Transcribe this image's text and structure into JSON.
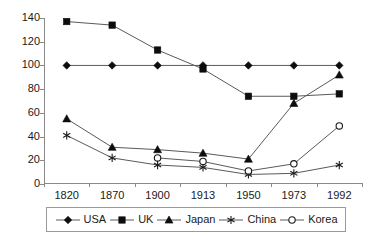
{
  "chart_data": {
    "type": "line",
    "title": "",
    "xlabel": "",
    "ylabel": "",
    "categories": [
      "1820",
      "1870",
      "1900",
      "1913",
      "1950",
      "1973",
      "1992"
    ],
    "ylim": [
      0,
      140
    ],
    "yticks": [
      0,
      20,
      40,
      60,
      80,
      100,
      120,
      140
    ],
    "grid": false,
    "legend_position": "bottom",
    "series": [
      {
        "name": "USA",
        "marker": "filled-diamond",
        "values": [
          100,
          100,
          100,
          100,
          100,
          100,
          100
        ]
      },
      {
        "name": "UK",
        "marker": "filled-square",
        "values": [
          137,
          134,
          113,
          97,
          74,
          74,
          76
        ]
      },
      {
        "name": "Japan",
        "marker": "filled-triangle",
        "values": [
          55,
          31,
          29,
          26,
          21,
          68,
          92
        ]
      },
      {
        "name": "China",
        "marker": "asterisk",
        "values": [
          41,
          22,
          16,
          14,
          8,
          9,
          16
        ]
      },
      {
        "name": "Korea",
        "marker": "open-circle",
        "values": [
          null,
          null,
          22,
          19,
          11,
          17,
          49
        ]
      }
    ]
  },
  "legend": {
    "entries": [
      {
        "label": "USA",
        "marker": "filled-diamond"
      },
      {
        "label": "UK",
        "marker": "filled-square"
      },
      {
        "label": "Japan",
        "marker": "filled-triangle"
      },
      {
        "label": "China",
        "marker": "asterisk"
      },
      {
        "label": "Korea",
        "marker": "open-circle"
      }
    ]
  },
  "colors": {
    "line": "#5a5a5a",
    "marker": "#0d0d0d",
    "axis": "#8a8a8a",
    "text": "#1a1a1a",
    "background": "#ffffff"
  }
}
